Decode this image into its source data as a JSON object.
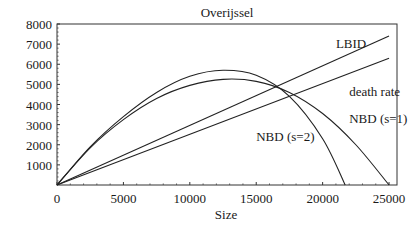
{
  "chart_data": {
    "type": "line",
    "title": "Overijssel",
    "xlabel": "Size",
    "ylabel": "",
    "xlim": [
      0,
      25600
    ],
    "ylim": [
      0,
      8000
    ],
    "xticks": [
      0,
      5000,
      10000,
      15000,
      20000,
      25000
    ],
    "xtick_labels": [
      "0",
      "5000",
      "10000",
      "15000",
      "20000",
      "25000"
    ],
    "yticks": [
      1000,
      2000,
      3000,
      4000,
      5000,
      6000,
      7000,
      8000
    ],
    "ytick_labels": [
      "1000",
      "2000",
      "3000",
      "4000",
      "5000",
      "6000",
      "7000",
      "8000"
    ],
    "grid": false,
    "legend": "inline labels",
    "series": [
      {
        "name": "LBID",
        "x": [
          0,
          25000
        ],
        "y": [
          0,
          7400
        ]
      },
      {
        "name": "death rate",
        "x": [
          0,
          25000
        ],
        "y": [
          0,
          6300
        ]
      },
      {
        "name": "NBD (s=1)",
        "x": [
          0,
          2500,
          5000,
          7500,
          10000,
          12500,
          15000,
          17500,
          20000,
          22500,
          25000
        ],
        "y": [
          0,
          1850,
          3250,
          4300,
          4950,
          5250,
          5150,
          4600,
          3550,
          2000,
          0
        ]
      },
      {
        "name": "NBD (s=2)",
        "x": [
          0,
          2500,
          5000,
          7500,
          10000,
          12500,
          15000,
          17500,
          20000,
          21700
        ],
        "y": [
          0,
          1900,
          3400,
          4600,
          5400,
          5700,
          5450,
          4400,
          2300,
          0
        ]
      }
    ],
    "annotations": [
      {
        "text": "LBID",
        "x": 21000,
        "y": 6800
      },
      {
        "text": "death rate",
        "x": 22000,
        "y": 4400
      },
      {
        "text": "NBD (s=1)",
        "x": 22000,
        "y": 3100
      },
      {
        "text": "NBD (s=2)",
        "x": 15000,
        "y": 2200
      }
    ]
  }
}
